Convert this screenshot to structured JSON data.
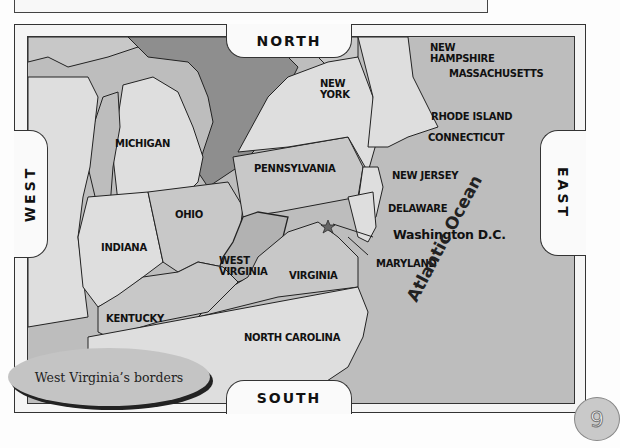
{
  "compass": {
    "north": "NORTH",
    "south": "SOUTH",
    "east": "EAST",
    "west": "WEST"
  },
  "states": {
    "michigan": "MICHIGAN",
    "ohio": "OHIO",
    "indiana": "INDIANA",
    "kentucky": "KENTUCKY",
    "west_virginia_line1": "WEST",
    "west_virginia_line2": "VIRGINIA",
    "virginia": "VIRGINIA",
    "north_carolina": "NORTH CAROLINA",
    "pennsylvania": "PENNSYLVANIA",
    "new_york_line1": "NEW",
    "new_york_line2": "YORK",
    "new_hampshire_line1": "NEW",
    "new_hampshire_line2": "HAMPSHIRE",
    "massachusetts": "MASSACHUSETTS",
    "rhode_island": "RHODE ISLAND",
    "connecticut": "CONNECTICUT",
    "new_jersey": "NEW JERSEY",
    "delaware": "DELAWARE",
    "maryland": "MARYLAND",
    "washington_dc": "Washington D.C."
  },
  "ocean": "Atlantic Ocean",
  "caption": "West Virginia’s borders",
  "page_number": "9",
  "colors": {
    "ocean": "#bdbdbd",
    "land_light": "#dedede",
    "land_mid": "#c8c8c8",
    "highlight_dark": "#8e8e8e",
    "border": "#333333"
  }
}
